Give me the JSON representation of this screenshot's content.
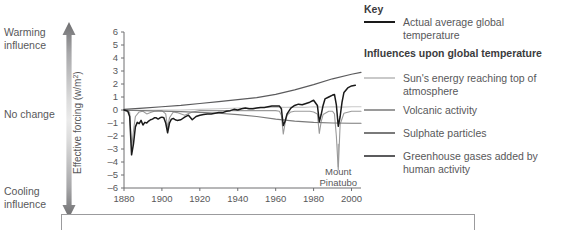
{
  "influence_axis": {
    "warming_label": "Warming\ninfluence",
    "warming_line1": "Warming",
    "warming_line2": "influence",
    "nochange_label": "No change",
    "cooling_line1": "Cooling",
    "cooling_line2": "influence",
    "arrow_dark_color": "#6e6e70",
    "arrow_light_color": "#e8e8e8"
  },
  "legend": {
    "key_heading": "Key",
    "influences_heading": "Influences upon global temperature",
    "items": [
      {
        "label": "Actual average global temperature",
        "color": "#1a1a1a"
      },
      {
        "label": "Sun's energy reaching top of atmosphere",
        "color": "#c9c9c9"
      },
      {
        "label": "Volcanic activity",
        "color": "#9a9a9a"
      },
      {
        "label": "Sulphate particles",
        "color": "#7a7a7a"
      },
      {
        "label": "Greenhouse gases added by human activity",
        "color": "#5b5b5d"
      }
    ]
  },
  "chart_data": {
    "type": "line",
    "title": "",
    "xlabel": "",
    "ylabel": "Effective forcing (w/m²)",
    "xlim": [
      1880,
      2005
    ],
    "ylim": [
      -6,
      6
    ],
    "xticks": [
      1880,
      1900,
      1920,
      1940,
      1960,
      1980,
      2000
    ],
    "yticks": [
      6,
      5,
      4,
      3,
      2,
      1,
      0,
      -1,
      -2,
      -3,
      -4,
      -5,
      -6
    ],
    "grid": false,
    "legend_position": "right-outside",
    "annotations": [
      {
        "text_line1": "Mount",
        "text_line2": "Pinatubo",
        "x": 1993,
        "y": -5.0,
        "pointer_to_x": 1993,
        "pointer_to_y": -2.6
      }
    ],
    "series": [
      {
        "name": "Actual average global temperature",
        "color": "#1a1a1a",
        "width": 1.5,
        "x": [
          1880,
          1882,
          1883,
          1884,
          1885,
          1886,
          1887,
          1888,
          1889,
          1890,
          1891,
          1892,
          1893,
          1894,
          1895,
          1896,
          1897,
          1898,
          1899,
          1900,
          1901,
          1902,
          1903,
          1904,
          1905,
          1906,
          1907,
          1908,
          1910,
          1912,
          1914,
          1916,
          1918,
          1920,
          1922,
          1924,
          1926,
          1928,
          1930,
          1932,
          1934,
          1936,
          1938,
          1940,
          1942,
          1944,
          1946,
          1948,
          1950,
          1952,
          1954,
          1956,
          1958,
          1960,
          1962,
          1963,
          1964,
          1965,
          1966,
          1968,
          1970,
          1972,
          1974,
          1976,
          1978,
          1980,
          1982,
          1983,
          1984,
          1985,
          1986,
          1988,
          1990,
          1991,
          1992,
          1993,
          1994,
          1995,
          1996,
          1998,
          2000,
          2002
        ],
        "y": [
          0.0,
          -0.1,
          -0.5,
          -3.45,
          -2.6,
          -1.3,
          -0.95,
          -1.05,
          -0.8,
          -1.15,
          -0.95,
          -1.0,
          -0.85,
          -0.75,
          -0.7,
          -0.6,
          -0.6,
          -0.7,
          -0.6,
          -0.55,
          -0.6,
          -1.0,
          -1.75,
          -1.0,
          -0.7,
          -0.65,
          -0.75,
          -0.8,
          -0.75,
          -0.55,
          -0.4,
          -0.75,
          -0.5,
          -0.4,
          -0.35,
          -0.3,
          -0.3,
          -0.25,
          -0.2,
          -0.2,
          -0.1,
          -0.05,
          0.05,
          0.0,
          0.1,
          0.15,
          0.1,
          0.1,
          0.15,
          0.2,
          0.2,
          0.25,
          0.3,
          0.3,
          0.3,
          0.1,
          -1.2,
          -0.85,
          -0.3,
          0.15,
          0.35,
          0.45,
          0.4,
          0.5,
          0.6,
          0.75,
          0.35,
          -0.9,
          -0.35,
          0.35,
          0.85,
          1.0,
          1.15,
          1.2,
          0.4,
          -1.25,
          -0.5,
          0.6,
          1.35,
          1.7,
          1.85,
          1.9
        ]
      },
      {
        "name": "Greenhouse gases added by human activity",
        "color": "#5b5b5d",
        "width": 1.2,
        "x": [
          1880,
          1890,
          1900,
          1910,
          1920,
          1930,
          1940,
          1950,
          1960,
          1970,
          1980,
          1990,
          2000,
          2005
        ],
        "y": [
          0.05,
          0.15,
          0.25,
          0.35,
          0.5,
          0.65,
          0.8,
          0.95,
          1.2,
          1.55,
          1.95,
          2.4,
          2.75,
          2.9
        ]
      },
      {
        "name": "Sulphate particles",
        "color": "#7a7a7a",
        "width": 1.2,
        "x": [
          1880,
          1890,
          1900,
          1910,
          1920,
          1930,
          1940,
          1950,
          1960,
          1970,
          1980,
          1990,
          2000,
          2005
        ],
        "y": [
          -0.02,
          -0.05,
          -0.08,
          -0.12,
          -0.18,
          -0.25,
          -0.35,
          -0.5,
          -0.7,
          -0.85,
          -0.95,
          -1.0,
          -1.02,
          -1.02
        ]
      },
      {
        "name": "Volcanic activity",
        "color": "#9a9a9a",
        "width": 1.1,
        "x": [
          1880,
          1882,
          1883,
          1884,
          1885,
          1886,
          1888,
          1890,
          1892,
          1894,
          1896,
          1898,
          1900,
          1902,
          1903,
          1904,
          1906,
          1908,
          1912,
          1916,
          1920,
          1930,
          1940,
          1950,
          1955,
          1960,
          1962,
          1963,
          1964,
          1965,
          1966,
          1968,
          1970,
          1974,
          1978,
          1980,
          1982,
          1983,
          1984,
          1985,
          1988,
          1990,
          1991,
          1992,
          1993,
          1994,
          1996,
          2000,
          2005
        ],
        "y": [
          0.0,
          0.0,
          -0.2,
          -2.9,
          -1.6,
          -0.5,
          -0.15,
          -0.1,
          -0.3,
          -0.2,
          -0.1,
          -0.05,
          -0.05,
          -0.3,
          -1.35,
          -0.6,
          -0.15,
          -0.2,
          -0.4,
          -0.15,
          -0.05,
          -0.05,
          -0.05,
          -0.05,
          -0.05,
          -0.05,
          -0.1,
          -0.4,
          -1.85,
          -1.0,
          -0.4,
          -0.15,
          -0.1,
          -0.1,
          -0.1,
          -0.15,
          -0.3,
          -1.8,
          -0.9,
          -0.35,
          -0.1,
          -0.1,
          -0.3,
          -2.0,
          -4.6,
          -1.1,
          -0.25,
          -0.1,
          -0.1
        ]
      },
      {
        "name": "Sun's energy reaching top of atmosphere",
        "color": "#c9c9c9",
        "width": 1.1,
        "x": [
          1880,
          1890,
          1900,
          1910,
          1920,
          1930,
          1940,
          1950,
          1955,
          1960,
          1965,
          1970,
          1975,
          1980,
          1985,
          1990,
          1995,
          2000,
          2005
        ],
        "y": [
          -0.05,
          -0.02,
          0.0,
          0.0,
          0.05,
          0.1,
          0.15,
          0.15,
          0.2,
          0.22,
          0.2,
          0.22,
          0.2,
          0.25,
          0.22,
          0.25,
          0.22,
          0.25,
          0.25
        ]
      }
    ]
  }
}
